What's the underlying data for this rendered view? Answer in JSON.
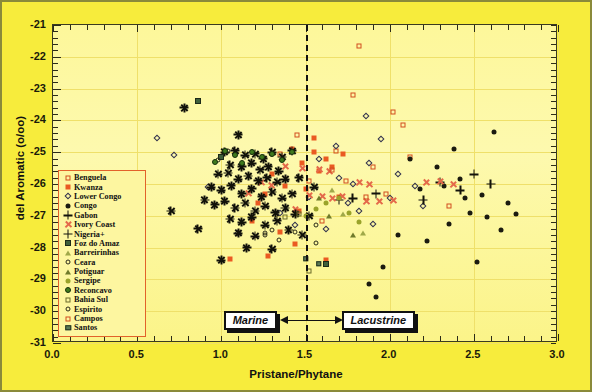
{
  "chart_data": {
    "type": "scatter",
    "title": "",
    "xlabel": "Pristane/Phytane",
    "ylabel": "del Aromatic (o/oo)",
    "xlim": [
      0.0,
      3.0
    ],
    "ylim": [
      -31,
      -21
    ],
    "xticks": [
      "0.0",
      "0.5",
      "1.0",
      "1.5",
      "2.0",
      "2.5",
      "3.0"
    ],
    "yticks": [
      "-21",
      "-22",
      "-23",
      "-24",
      "-25",
      "-26",
      "-27",
      "-28",
      "-29",
      "-30",
      "-31"
    ],
    "grid": true,
    "legend_position": "left-middle",
    "annotations": [
      {
        "label": "Marine",
        "x": 1.25,
        "direction": "left"
      },
      {
        "label": "Lacustrine",
        "x": 1.78,
        "direction": "right"
      }
    ],
    "reference_line": {
      "x": 1.5,
      "style": "dashed",
      "color": "#111111"
    },
    "series": [
      {
        "name": "Benguela",
        "marker": "square-open",
        "color": "#d14d1e",
        "points": [
          [
            1.82,
            -21.65
          ],
          [
            2.02,
            -23.75
          ],
          [
            2.08,
            -24.15
          ],
          [
            1.45,
            -24.45
          ],
          [
            1.68,
            -24.95
          ],
          [
            1.9,
            -25.45
          ],
          [
            1.78,
            -23.2
          ],
          [
            2.35,
            -26.7
          ],
          [
            1.6,
            -27.15
          ],
          [
            1.98,
            -26.3
          ],
          [
            1.35,
            -25.05
          ],
          [
            1.52,
            -25.9
          ],
          [
            2.12,
            -25.15
          ]
        ]
      },
      {
        "name": "Kwanza",
        "marker": "square-filled",
        "color": "#ea5a22",
        "points": [
          [
            1.42,
            -24.9
          ],
          [
            1.55,
            -25.0
          ],
          [
            1.62,
            -25.2
          ],
          [
            1.48,
            -25.35
          ],
          [
            1.58,
            -25.6
          ],
          [
            1.3,
            -25.7
          ],
          [
            1.38,
            -26.05
          ],
          [
            1.5,
            -26.15
          ],
          [
            1.66,
            -25.45
          ],
          [
            1.72,
            -25.05
          ],
          [
            1.22,
            -26.6
          ],
          [
            1.46,
            -26.85
          ],
          [
            1.05,
            -28.35
          ],
          [
            1.28,
            -28.25
          ],
          [
            1.62,
            -28.4
          ],
          [
            1.35,
            -27.5
          ],
          [
            1.18,
            -27.15
          ],
          [
            1.55,
            -24.55
          ],
          [
            1.7,
            -26.4
          ],
          [
            1.26,
            -26.3
          ],
          [
            1.44,
            -27.9
          ]
        ]
      },
      {
        "name": "Lower Congo",
        "marker": "diamond-open",
        "color": "#32324e",
        "points": [
          [
            0.72,
            -25.1
          ],
          [
            0.62,
            -24.55
          ],
          [
            0.92,
            -26.1
          ],
          [
            1.1,
            -27.55
          ],
          [
            1.62,
            -27.4
          ],
          [
            1.78,
            -26.0
          ],
          [
            1.88,
            -25.35
          ],
          [
            1.95,
            -24.6
          ],
          [
            2.0,
            -26.45
          ],
          [
            1.7,
            -25.8
          ],
          [
            1.52,
            -26.4
          ],
          [
            1.35,
            -26.9
          ],
          [
            1.82,
            -26.85
          ],
          [
            2.15,
            -26.05
          ],
          [
            1.58,
            -25.2
          ],
          [
            1.9,
            -27.25
          ],
          [
            2.05,
            -25.7
          ],
          [
            1.68,
            -24.8
          ],
          [
            1.44,
            -27.3
          ],
          [
            2.2,
            -26.7
          ],
          [
            1.75,
            -26.6
          ],
          [
            1.86,
            -23.85
          ]
        ]
      },
      {
        "name": "Congo",
        "marker": "dot",
        "color": "#1b1b10",
        "points": [
          [
            2.62,
            -24.35
          ],
          [
            2.28,
            -25.45
          ],
          [
            2.42,
            -25.85
          ],
          [
            2.55,
            -26.35
          ],
          [
            2.7,
            -26.6
          ],
          [
            2.48,
            -26.9
          ],
          [
            2.35,
            -27.25
          ],
          [
            2.58,
            -27.05
          ],
          [
            2.75,
            -26.95
          ],
          [
            2.18,
            -26.15
          ],
          [
            2.32,
            -26.05
          ],
          [
            2.45,
            -26.45
          ],
          [
            2.66,
            -27.45
          ],
          [
            2.22,
            -27.8
          ],
          [
            2.05,
            -27.6
          ],
          [
            2.52,
            -28.45
          ],
          [
            1.96,
            -28.6
          ],
          [
            1.88,
            -29.15
          ],
          [
            1.92,
            -29.55
          ],
          [
            2.12,
            -25.2
          ],
          [
            2.38,
            -24.9
          ]
        ]
      },
      {
        "name": "Gabon",
        "marker": "plus",
        "color": "#12120a",
        "points": [
          [
            2.3,
            -25.95
          ],
          [
            2.42,
            -26.2
          ],
          [
            2.2,
            -26.5
          ],
          [
            1.7,
            -26.5
          ],
          [
            1.78,
            -26.45
          ],
          [
            1.92,
            -26.3
          ],
          [
            2.6,
            -26.0
          ],
          [
            2.5,
            -25.7
          ]
        ]
      },
      {
        "name": "Ivory Coast",
        "marker": "x-cross",
        "color": "#e4694a",
        "points": [
          [
            1.52,
            -26.35
          ],
          [
            1.6,
            -26.4
          ],
          [
            1.66,
            -26.45
          ],
          [
            1.72,
            -26.4
          ],
          [
            1.58,
            -25.55
          ],
          [
            1.64,
            -25.6
          ],
          [
            1.86,
            -26.55
          ],
          [
            1.94,
            -26.55
          ],
          [
            2.02,
            -26.5
          ],
          [
            1.82,
            -25.95
          ],
          [
            1.88,
            -26.0
          ],
          [
            2.22,
            -25.95
          ],
          [
            2.3,
            -25.9
          ],
          [
            2.38,
            -26.0
          ],
          [
            1.44,
            -26.8
          ],
          [
            1.3,
            -26.05
          ],
          [
            1.24,
            -25.95
          ],
          [
            1.16,
            -26.3
          ],
          [
            1.38,
            -25.45
          ],
          [
            1.48,
            -25.5
          ]
        ]
      },
      {
        "name": "Nigeria+",
        "marker": "star",
        "color": "#12120a",
        "points": [
          [
            1.02,
            -25.0
          ],
          [
            1.08,
            -24.95
          ],
          [
            1.14,
            -25.1
          ],
          [
            1.2,
            -25.05
          ],
          [
            1.25,
            -25.2
          ],
          [
            1.3,
            -25.0
          ],
          [
            1.36,
            -25.15
          ],
          [
            1.05,
            -25.4
          ],
          [
            1.12,
            -25.45
          ],
          [
            1.18,
            -25.35
          ],
          [
            1.23,
            -25.55
          ],
          [
            1.28,
            -25.45
          ],
          [
            1.34,
            -25.6
          ],
          [
            0.98,
            -25.7
          ],
          [
            1.04,
            -25.65
          ],
          [
            1.1,
            -25.85
          ],
          [
            1.16,
            -25.75
          ],
          [
            1.22,
            -25.9
          ],
          [
            1.27,
            -25.8
          ],
          [
            1.33,
            -25.95
          ],
          [
            1.38,
            -25.85
          ],
          [
            0.94,
            -26.1
          ],
          [
            1.0,
            -26.2
          ],
          [
            1.06,
            -26.05
          ],
          [
            1.12,
            -26.3
          ],
          [
            1.18,
            -26.15
          ],
          [
            1.24,
            -26.4
          ],
          [
            1.3,
            -26.25
          ],
          [
            1.36,
            -26.45
          ],
          [
            1.42,
            -26.3
          ],
          [
            0.9,
            -26.5
          ],
          [
            0.96,
            -26.65
          ],
          [
            1.02,
            -26.55
          ],
          [
            1.08,
            -26.75
          ],
          [
            1.14,
            -26.6
          ],
          [
            1.2,
            -26.85
          ],
          [
            1.26,
            -26.7
          ],
          [
            1.32,
            -26.9
          ],
          [
            1.38,
            -26.75
          ],
          [
            1.44,
            -26.95
          ],
          [
            1.05,
            -27.1
          ],
          [
            1.12,
            -27.2
          ],
          [
            1.18,
            -27.05
          ],
          [
            1.26,
            -27.3
          ],
          [
            1.33,
            -27.15
          ],
          [
            0.86,
            -27.4
          ],
          [
            1.1,
            -27.55
          ],
          [
            1.2,
            -27.65
          ],
          [
            1.4,
            -27.45
          ],
          [
            1.48,
            -27.6
          ],
          [
            0.7,
            -26.85
          ],
          [
            1.15,
            -28.0
          ],
          [
            1.3,
            -28.05
          ],
          [
            1.55,
            -26.1
          ],
          [
            0.78,
            -23.6
          ],
          [
            1.42,
            -24.95
          ],
          [
            1.1,
            -24.45
          ],
          [
            1.46,
            -25.8
          ],
          [
            1.52,
            -27.0
          ],
          [
            1.0,
            -28.4
          ]
        ]
      },
      {
        "name": "Foz do Amaz",
        "marker": "square-dark",
        "color": "#3f5f3a",
        "points": [
          [
            0.86,
            -23.4
          ],
          [
            1.62,
            -28.5
          ],
          [
            1.0,
            -25.15
          ]
        ]
      },
      {
        "name": "Barreirinhas",
        "marker": "triangle-open",
        "color": "#8e9a3a",
        "points": [
          [
            1.72,
            -26.95
          ],
          [
            1.84,
            -27.55
          ],
          [
            1.66,
            -26.2
          ]
        ]
      },
      {
        "name": "Ceara",
        "marker": "circle-open",
        "color": "#2a2a18",
        "points": [
          [
            1.04,
            -24.95
          ],
          [
            0.98,
            -25.25
          ],
          [
            1.3,
            -27.45
          ],
          [
            1.44,
            -27.5
          ],
          [
            1.56,
            -27.3
          ],
          [
            1.26,
            -27.55
          ]
        ]
      },
      {
        "name": "Potiguar",
        "marker": "triangle-filled",
        "color": "#6f7a2b",
        "points": [
          [
            1.64,
            -27.0
          ],
          [
            1.78,
            -27.6
          ],
          [
            1.58,
            -26.45
          ]
        ]
      },
      {
        "name": "Sergipe",
        "marker": "circle-olive",
        "color": "#9aa32a",
        "points": [
          [
            1.62,
            -26.6
          ],
          [
            1.7,
            -26.45
          ],
          [
            1.76,
            -26.9
          ],
          [
            1.56,
            -26.8
          ],
          [
            1.82,
            -27.2
          ],
          [
            1.5,
            -27.0
          ]
        ]
      },
      {
        "name": "Reconcavo",
        "marker": "circle-green",
        "color": "#3f7a1e",
        "points": [
          [
            1.02,
            -24.95
          ],
          [
            1.08,
            -25.1
          ],
          [
            1.18,
            -25.0
          ],
          [
            1.24,
            -25.15
          ],
          [
            1.3,
            -25.05
          ],
          [
            0.96,
            -25.3
          ],
          [
            1.12,
            -25.35
          ],
          [
            1.36,
            -25.25
          ],
          [
            1.42,
            -25.0
          ]
        ]
      },
      {
        "name": "Bahia Sul",
        "marker": "square-olive-open",
        "color": "#6b6b2a",
        "points": [
          [
            1.52,
            -28.75
          ],
          [
            1.46,
            -26.95
          ],
          [
            1.38,
            -27.05
          ]
        ]
      },
      {
        "name": "Espirito",
        "marker": "circle-small-open",
        "color": "#2a2a18",
        "points": [
          [
            1.26,
            -27.6
          ],
          [
            1.34,
            -27.75
          ],
          [
            1.56,
            -27.85
          ]
        ]
      },
      {
        "name": "Campos",
        "marker": "square-open-sm",
        "color": "#d14d1e",
        "points": [
          [
            1.74,
            -25.9
          ],
          [
            1.66,
            -25.55
          ],
          [
            1.86,
            -26.4
          ]
        ]
      },
      {
        "name": "Santos",
        "marker": "square-teal",
        "color": "#5a7a55",
        "points": [
          [
            1.58,
            -28.5
          ],
          [
            1.5,
            -28.35
          ]
        ]
      }
    ]
  },
  "axes": {
    "x_title": "Pristane/Phytane",
    "y_title": "del Aromatic (o/oo)",
    "x_ticks": [
      "0.0",
      "0.5",
      "1.0",
      "1.5",
      "2.0",
      "2.5",
      "3.0"
    ],
    "y_ticks": [
      "-21",
      "-22",
      "-23",
      "-24",
      "-25",
      "-26",
      "-27",
      "-28",
      "-29",
      "-30",
      "-31"
    ]
  },
  "annotations": {
    "marine_label": "Marine",
    "lacustrine_label": "Lacustrine"
  },
  "legend": {
    "items": [
      {
        "label": "Benguela",
        "marker": "square-open"
      },
      {
        "label": "Kwanza",
        "marker": "square-filled"
      },
      {
        "label": "Lower Congo",
        "marker": "diamond-open"
      },
      {
        "label": "Congo",
        "marker": "dot"
      },
      {
        "label": "Gabon",
        "marker": "plus"
      },
      {
        "label": "Ivory Coast",
        "marker": "x-cross"
      },
      {
        "label": "Nigeria+",
        "marker": "plus"
      },
      {
        "label": "Foz do Amaz",
        "marker": "square-dark"
      },
      {
        "label": "Barreirinhas",
        "marker": "triangle-open"
      },
      {
        "label": "Ceara",
        "marker": "circle-open"
      },
      {
        "label": "Potiguar",
        "marker": "triangle-filled"
      },
      {
        "label": "Sergipe",
        "marker": "circle-olive"
      },
      {
        "label": "Reconcavo",
        "marker": "circle-green"
      },
      {
        "label": "Bahia Sul",
        "marker": "square-olive-open"
      },
      {
        "label": "Espirito",
        "marker": "circle-small-open"
      },
      {
        "label": "Campos",
        "marker": "square-open-sm"
      },
      {
        "label": "Santos",
        "marker": "square-teal"
      }
    ]
  },
  "colors": {
    "figure_background": "#f7ec3c",
    "plot_background": "#fdf79a",
    "grid": "#efe06a",
    "frame": "#3a3a20",
    "legend_border": "#e2622a",
    "divider": "#111111"
  }
}
